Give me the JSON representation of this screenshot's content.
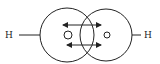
{
  "diagram": {
    "type": "molecular-orbital-overlap",
    "left_atom_label": "H",
    "right_atom_label": "H",
    "stroke_color": "#222222",
    "background": "#ffffff",
    "elements": {
      "left_circle": {
        "cx": 67,
        "cy": 35,
        "r": 27
      },
      "right_circle": {
        "cx": 106,
        "cy": 35,
        "r": 26
      },
      "left_nucleus": {
        "cx": 68,
        "cy": 35,
        "r": 4
      },
      "right_nucleus": {
        "cx": 107,
        "cy": 35,
        "r": 3
      },
      "arrows": [
        {
          "y": 25,
          "x1": 62,
          "x2": 102,
          "direction": "double"
        },
        {
          "y": 45,
          "x1": 66,
          "x2": 102,
          "direction": "double"
        }
      ]
    }
  }
}
